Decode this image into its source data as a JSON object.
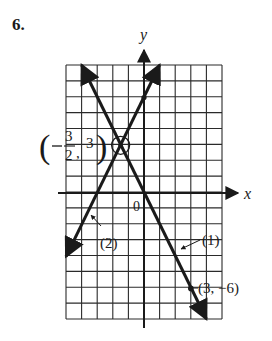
{
  "problem": {
    "number": "6."
  },
  "axes": {
    "x_label": "x",
    "y_label": "y",
    "origin_label": "0"
  },
  "grid": {
    "x_min": -5,
    "x_max": 5,
    "y_min": -8,
    "y_max": 8
  },
  "lines": [
    {
      "label": "(1)",
      "equation": "y = -2x",
      "slope": -2,
      "intercept": 0
    },
    {
      "label": "(2)",
      "equation": "y = 2x + 6",
      "slope": 2,
      "intercept": 6
    }
  ],
  "points": [
    {
      "name": "intersection",
      "x": -1.5,
      "y": 3,
      "label_num": "3",
      "label_den": "2",
      "label_y": "3"
    },
    {
      "name": "point-on-line-1",
      "x": 3,
      "y": -6,
      "label": "(3, −6)"
    },
    {
      "name": "y-intercept-line-2",
      "x": 0,
      "y": 6
    }
  ],
  "colors": {
    "ink": "#1a1a1a",
    "grid": "#2a2a2a",
    "paper": "#ffffff"
  }
}
